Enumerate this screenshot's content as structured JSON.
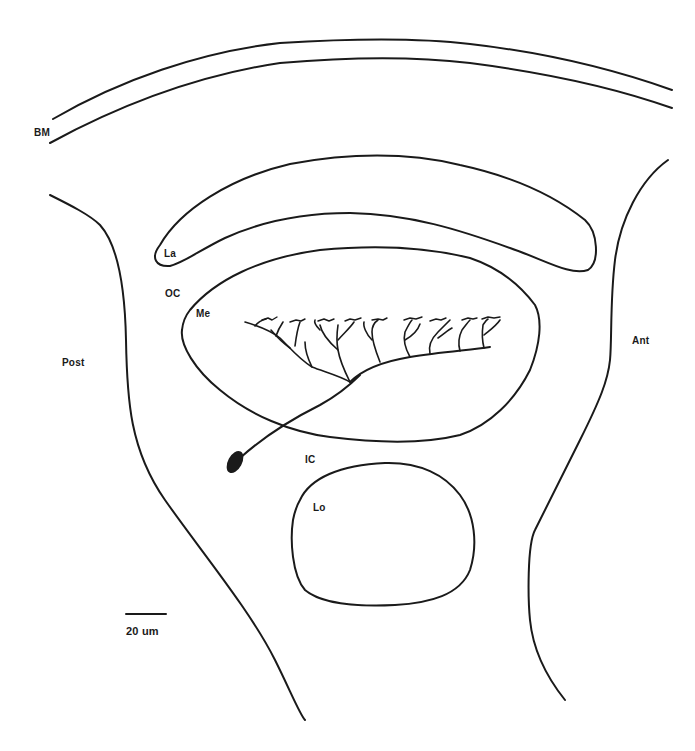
{
  "figure": {
    "type": "neuroanatomy line drawing",
    "colors": {
      "ink": "#1a1a1a",
      "background": "#ffffff"
    }
  },
  "labels": {
    "bm": "BM",
    "la": "La",
    "oc": "OC",
    "me": "Me",
    "post": "Post",
    "ant": "Ant",
    "ic": "IC",
    "lo": "Lo"
  },
  "scale_bar": {
    "text": "20 um",
    "length_px": 40
  },
  "structures": [
    {
      "id": "BM",
      "name": "basement membrane (double arc)"
    },
    {
      "id": "La",
      "name": "lamina (elongated crescent)"
    },
    {
      "id": "OC",
      "name": "outer chiasm"
    },
    {
      "id": "Me",
      "name": "medulla (oval neuropil)"
    },
    {
      "id": "IC",
      "name": "inner chiasm"
    },
    {
      "id": "Lo",
      "name": "lobula (rounded neuropil)"
    },
    {
      "id": "neuron",
      "name": "medulla neuron with soma, axon and dendritic arbor"
    }
  ],
  "orientation": {
    "left": "Post",
    "right": "Ant"
  }
}
